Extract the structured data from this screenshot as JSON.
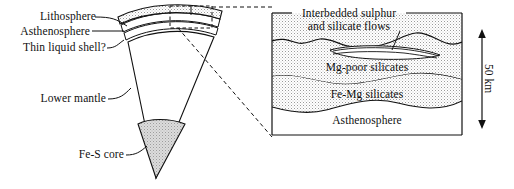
{
  "figure": {
    "background_color": "#ffffff",
    "line_color": "#111111",
    "stipple_color": "#d8d8d8"
  },
  "wedge_panel": {
    "labels": {
      "lithosphere": "Lithosphere",
      "asthenosphere": "Asthenosphere",
      "thin_liquid_shell": "Thin liquid shell?",
      "lower_mantle": "Lower  mantle",
      "fe_s_core": "Fe-S core"
    }
  },
  "inset_panel": {
    "header_line1": "Interbedded sulphur",
    "header_line2": "and silicate flows",
    "layers": [
      {
        "name": "Mg-poor silicates"
      },
      {
        "name": "Fe-Mg silicates"
      },
      {
        "name": "Asthenosphere"
      }
    ],
    "scale": {
      "label": "50 km"
    }
  }
}
